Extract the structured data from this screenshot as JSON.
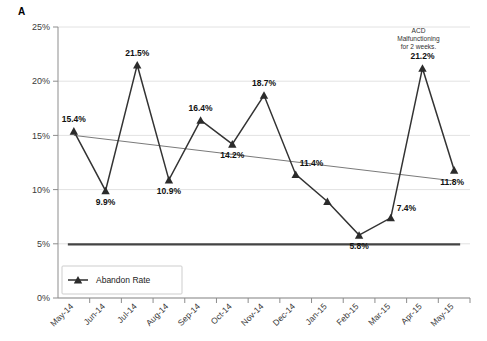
{
  "panel": {
    "label": "A"
  },
  "chart_data": {
    "type": "line",
    "title": "",
    "xlabel": "",
    "ylabel": "",
    "ylim": [
      0,
      25
    ],
    "ytick_labels": [
      "0%",
      "5%",
      "10%",
      "15%",
      "20%",
      "25%"
    ],
    "ytick_values": [
      0,
      5,
      10,
      15,
      20,
      25
    ],
    "grid": true,
    "legend_position": "bottom-left",
    "categories": [
      "May-14",
      "Jun-14",
      "Jul-14",
      "Aug-14",
      "Sep-14",
      "Oct-14",
      "Nov-14",
      "Dec-14",
      "Jan-15",
      "Feb-15",
      "Mar-15",
      "Apr-15",
      "May-15"
    ],
    "series": [
      {
        "name": "Abandon Rate",
        "marker": "triangle",
        "values": [
          15.4,
          9.9,
          21.5,
          10.9,
          16.4,
          14.2,
          18.7,
          11.4,
          8.9,
          5.8,
          7.4,
          21.2,
          11.8
        ],
        "point_labels": [
          "15.4%",
          "9.9%",
          "21.5%",
          "10.9%",
          "16.4%",
          "14.2%",
          "18.7%",
          "11.4%",
          "",
          "5.8%",
          "7.4%",
          "21.2%",
          "11.8%"
        ]
      },
      {
        "name": "Trend",
        "marker": "none",
        "values": [
          15.0,
          14.65,
          14.3,
          13.95,
          13.6,
          13.25,
          12.9,
          12.55,
          12.2,
          11.85,
          11.5,
          11.15,
          10.8
        ],
        "point_labels": []
      },
      {
        "name": "Goal",
        "marker": "none",
        "values": [
          4.95,
          4.95,
          4.95,
          4.95,
          4.95,
          4.95,
          4.95,
          4.95,
          4.95,
          4.95,
          4.95,
          4.95,
          4.95
        ],
        "point_labels": []
      }
    ],
    "annotations": [
      {
        "target_category": "Apr-15",
        "lines": [
          "ACD",
          "Malfunctioning",
          "for 2 weeks."
        ]
      }
    ],
    "legend": [
      {
        "label": "Abandon Rate",
        "marker": "triangle",
        "color": "#2b2b2b"
      }
    ]
  },
  "colors": {
    "series": "#333333",
    "trend": "#7a7a7a",
    "goal": "#444444",
    "grid": "#e2e2e2",
    "axis": "#8d8d8d"
  }
}
